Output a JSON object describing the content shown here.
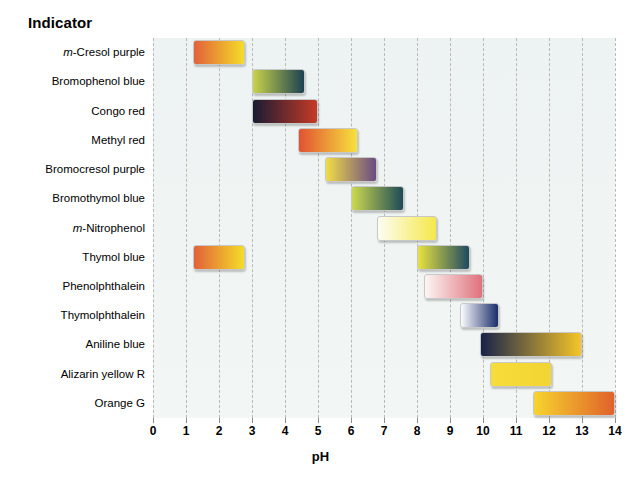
{
  "header": {
    "indicator_label": "Indicator"
  },
  "axis": {
    "title": "pH",
    "ticks": [
      "0",
      "1",
      "2",
      "3",
      "4",
      "5",
      "6",
      "7",
      "8",
      "9",
      "10",
      "11",
      "12",
      "13",
      "14"
    ]
  },
  "chart_data": {
    "type": "bar",
    "title": "Indicator",
    "subtitle": "",
    "xlabel": "pH",
    "ylabel": "Indicator",
    "xlim": [
      0,
      14
    ],
    "grid": true,
    "grid_axis": "x",
    "legend": "none",
    "orientation": "horizontal",
    "note": "Horizontal range (gantt-style) bars showing the pH transition interval of each acid-base indicator; each bar is filled with a gradient from its acid-form colour to its base-form colour.",
    "categories": [
      "m-Cresol purple",
      "Bromophenol blue",
      "Congo red",
      "Methyl red",
      "Bromocresol purple",
      "Bromothymol blue",
      "m-Nitrophenol",
      "Thymol blue",
      "Phenolphthalein",
      "Thymolphthalein",
      "Aniline blue",
      "Alizarin yellow R",
      "Orange G"
    ],
    "bars": [
      {
        "name": "m-Cresol purple",
        "label_html": "<span class='ital'>m</span>-Cresol purple",
        "start": 1.2,
        "end": 2.8,
        "acid_color": "#e2613a",
        "base_color": "#f4dd28"
      },
      {
        "name": "Bromophenol blue",
        "label_html": "Bromophenol blue",
        "start": 3.0,
        "end": 4.6,
        "acid_color": "#c9d34a",
        "base_color": "#1d4152"
      },
      {
        "name": "Congo red",
        "label_html": "Congo red",
        "start": 3.0,
        "end": 5.0,
        "acid_color": "#191b33",
        "base_color": "#c63a26"
      },
      {
        "name": "Methyl red",
        "label_html": "Methyl red",
        "start": 4.4,
        "end": 6.2,
        "acid_color": "#e25232",
        "base_color": "#f6e23d"
      },
      {
        "name": "Bromocresol purple",
        "label_html": "Bromocresol purple",
        "start": 5.2,
        "end": 6.8,
        "acid_color": "#f2dc46",
        "base_color": "#6a4a84"
      },
      {
        "name": "Bromothymol blue",
        "label_html": "Bromothymol blue",
        "start": 6.0,
        "end": 7.6,
        "acid_color": "#ccd94e",
        "base_color": "#1e4a58"
      },
      {
        "name": "m-Nitrophenol",
        "label_html": "<span class='ital'>m</span>-Nitrophenol",
        "start": 6.8,
        "end": 8.6,
        "acid_color": "#fdfdf2",
        "base_color": "#f5e84a"
      },
      {
        "name": "Thymol blue",
        "label_html": "Thymol blue",
        "start": 1.2,
        "end": 2.8,
        "acid_color": "#e2613a",
        "base_color": "#f4dd28"
      },
      {
        "name": "Thymol blue (2)",
        "label_html": "",
        "start": 8.0,
        "end": 9.6,
        "acid_color": "#e8e23f",
        "base_color": "#1e4a63"
      },
      {
        "name": "Phenolphthalein",
        "label_html": "Phenolphthalein",
        "start": 8.2,
        "end": 10.0,
        "acid_color": "#fbf6f4",
        "base_color": "#e0717c"
      },
      {
        "name": "Thymolphthalein",
        "label_html": "Thymolphthalein",
        "start": 9.3,
        "end": 10.5,
        "acid_color": "#fbfcfd",
        "base_color": "#1b2d6b"
      },
      {
        "name": "Aniline blue",
        "label_html": "Aniline blue",
        "start": 9.9,
        "end": 13.0,
        "acid_color": "#17224b",
        "base_color": "#f5c528"
      },
      {
        "name": "Alizarin yellow R",
        "label_html": "Alizarin yellow R",
        "start": 10.2,
        "end": 12.1,
        "acid_color": "#f7dd3a",
        "base_color": "#f2d433"
      },
      {
        "name": "Orange G",
        "label_html": "Orange G",
        "start": 11.5,
        "end": 14.0,
        "acid_color": "#f7d42e",
        "base_color": "#e0622a"
      }
    ],
    "row_of_bar": [
      0,
      1,
      2,
      3,
      4,
      5,
      6,
      7,
      7,
      8,
      9,
      10,
      11,
      12
    ]
  },
  "colors": {
    "plot_background": "#eef4f3",
    "gridline": "#b9b9b9",
    "page_background": "#ffffff",
    "text": "#000000"
  }
}
